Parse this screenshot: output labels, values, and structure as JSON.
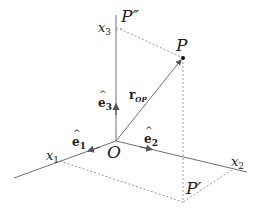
{
  "figure": {
    "type": "3D Cartesian coordinate system with position vector",
    "colors": {
      "axis": "#707070",
      "dashed": "#9a9a9a",
      "text": "#222222",
      "point": "#111111"
    }
  },
  "axes": {
    "x1": {
      "label": "x",
      "sub": "1"
    },
    "x2": {
      "label": "x",
      "sub": "2"
    },
    "x3": {
      "label": "x",
      "sub": "3"
    }
  },
  "unit_vectors": {
    "e1": {
      "label": "e",
      "sub": "1"
    },
    "e2": {
      "label": "e",
      "sub": "2"
    },
    "e3": {
      "label": "e",
      "sub": "3"
    }
  },
  "points": {
    "origin": {
      "label": "O"
    },
    "P": {
      "label": "P"
    },
    "P_prime": {
      "label": "P′"
    },
    "P_double_prime": {
      "label": "P″"
    }
  },
  "vector": {
    "r": {
      "label": "r",
      "sub": "OP"
    }
  }
}
